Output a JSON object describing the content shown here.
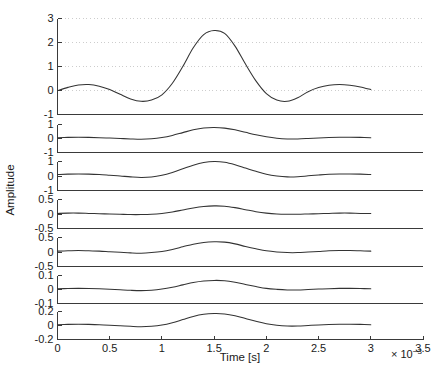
{
  "figure": {
    "xlabel": "Time [s]",
    "ylabel": "Amplitude",
    "x_exponent_base": "× 10",
    "x_exponent_power": "−3",
    "background_color": "#ffffff",
    "line_color": "#333333",
    "axis_color": "#3a3a3a",
    "grid_color": "#c8c8c8"
  },
  "chart_data": {
    "type": "line",
    "title": "",
    "subtitle": "",
    "xlabel": "Time [s]",
    "ylabel": "Amplitude",
    "x_scale_factor": "1e-3",
    "x_tick_labels": [
      "0",
      "0.5",
      "1",
      "1.5",
      "2",
      "2.5",
      "3",
      "3.5"
    ],
    "x_ticks": [
      0,
      0.5,
      1,
      1.5,
      2,
      2.5,
      3,
      3.5
    ],
    "xlim": [
      0,
      3.5
    ],
    "legend": "none",
    "grid": "horizontal dotted on panel 1 only",
    "layout": "7 stacked subplots sharing one x-axis",
    "panels": [
      {
        "index": 1,
        "ylim": [
          -1,
          3
        ],
        "y_ticks": [
          -1,
          0,
          1,
          2,
          3
        ],
        "y_tick_labels": [
          "-1",
          "0",
          "1",
          "2",
          "3"
        ],
        "grid": true,
        "peak_value": 2.5,
        "peak_time": 1.5,
        "x": [
          0,
          0.1,
          0.2,
          0.3,
          0.4,
          0.5,
          0.6,
          0.7,
          0.8,
          0.9,
          1.0,
          1.1,
          1.2,
          1.3,
          1.4,
          1.5,
          1.6,
          1.7,
          1.8,
          1.9,
          2.0,
          2.1,
          2.2,
          2.3,
          2.4,
          2.5,
          2.6,
          2.7,
          2.8,
          2.9,
          3.0
        ],
        "y": [
          0.0,
          0.13,
          0.23,
          0.25,
          0.18,
          0.04,
          -0.16,
          -0.35,
          -0.45,
          -0.4,
          -0.18,
          0.3,
          1.0,
          1.78,
          2.33,
          2.5,
          2.38,
          1.85,
          1.1,
          0.4,
          -0.13,
          -0.4,
          -0.45,
          -0.3,
          -0.05,
          0.12,
          0.22,
          0.25,
          0.22,
          0.15,
          0.04
        ]
      },
      {
        "index": 2,
        "ylim": [
          -1,
          1
        ],
        "y_ticks": [
          -1,
          0,
          1
        ],
        "y_tick_labels": [
          "-1",
          "0",
          "1"
        ],
        "grid": false,
        "peak_value": 0.78,
        "peak_time": 1.5,
        "x": [
          0,
          0.1,
          0.2,
          0.3,
          0.4,
          0.5,
          0.6,
          0.7,
          0.8,
          0.9,
          1.0,
          1.1,
          1.2,
          1.3,
          1.4,
          1.5,
          1.6,
          1.7,
          1.8,
          1.9,
          2.0,
          2.1,
          2.2,
          2.3,
          2.4,
          2.5,
          2.6,
          2.7,
          2.8,
          2.9,
          3.0
        ],
        "y": [
          0.06,
          0.08,
          0.09,
          0.08,
          0.06,
          0.03,
          0.0,
          -0.03,
          -0.05,
          -0.02,
          0.07,
          0.22,
          0.42,
          0.62,
          0.75,
          0.78,
          0.74,
          0.62,
          0.44,
          0.26,
          0.12,
          0.02,
          -0.03,
          -0.03,
          0.0,
          0.04,
          0.07,
          0.09,
          0.09,
          0.08,
          0.06
        ]
      },
      {
        "index": 3,
        "ylim": [
          -1,
          1
        ],
        "y_ticks": [
          -1,
          0,
          1
        ],
        "y_tick_labels": [
          "-1",
          "0",
          "1"
        ],
        "grid": false,
        "peak_value": 1.0,
        "peak_time": 1.5,
        "x": [
          0,
          0.1,
          0.2,
          0.3,
          0.4,
          0.5,
          0.6,
          0.7,
          0.8,
          0.9,
          1.0,
          1.1,
          1.2,
          1.3,
          1.4,
          1.5,
          1.6,
          1.7,
          1.8,
          1.9,
          2.0,
          2.1,
          2.2,
          2.3,
          2.4,
          2.5,
          2.6,
          2.7,
          2.8,
          2.9,
          3.0
        ],
        "y": [
          0.1,
          0.13,
          0.14,
          0.13,
          0.1,
          0.05,
          0.0,
          -0.06,
          -0.1,
          -0.07,
          0.05,
          0.25,
          0.5,
          0.75,
          0.93,
          1.0,
          0.95,
          0.78,
          0.55,
          0.32,
          0.12,
          0.0,
          -0.06,
          -0.05,
          0.01,
          0.07,
          0.12,
          0.14,
          0.14,
          0.13,
          0.1
        ]
      },
      {
        "index": 4,
        "ylim": [
          -0.5,
          0.5
        ],
        "y_ticks": [
          -0.5,
          0,
          0.5
        ],
        "y_tick_labels": [
          "-0.5",
          "0",
          "0.5"
        ],
        "grid": false,
        "peak_value": 0.28,
        "peak_time": 1.5,
        "x": [
          0,
          0.1,
          0.2,
          0.3,
          0.4,
          0.5,
          0.6,
          0.7,
          0.8,
          0.9,
          1.0,
          1.1,
          1.2,
          1.3,
          1.4,
          1.5,
          1.6,
          1.7,
          1.8,
          1.9,
          2.0,
          2.1,
          2.2,
          2.3,
          2.4,
          2.5,
          2.6,
          2.7,
          2.8,
          2.9,
          3.0
        ],
        "y": [
          0.02,
          0.03,
          0.03,
          0.02,
          0.01,
          0.0,
          -0.01,
          -0.02,
          -0.02,
          -0.01,
          0.02,
          0.07,
          0.14,
          0.21,
          0.26,
          0.28,
          0.27,
          0.22,
          0.15,
          0.08,
          0.03,
          0.0,
          -0.01,
          -0.01,
          0.0,
          0.01,
          0.02,
          0.03,
          0.03,
          0.02,
          0.02
        ]
      },
      {
        "index": 5,
        "ylim": [
          -0.5,
          0.5
        ],
        "y_ticks": [
          -0.5,
          0,
          0.5
        ],
        "y_tick_labels": [
          "-0.5",
          "0",
          "0.5"
        ],
        "grid": false,
        "peak_value": 0.35,
        "peak_time": 1.5,
        "x": [
          0,
          0.1,
          0.2,
          0.3,
          0.4,
          0.5,
          0.6,
          0.7,
          0.8,
          0.9,
          1.0,
          1.1,
          1.2,
          1.3,
          1.4,
          1.5,
          1.6,
          1.7,
          1.8,
          1.9,
          2.0,
          2.1,
          2.2,
          2.3,
          2.4,
          2.5,
          2.6,
          2.7,
          2.8,
          2.9,
          3.0
        ],
        "y": [
          0.03,
          0.04,
          0.05,
          0.04,
          0.03,
          0.01,
          -0.01,
          -0.03,
          -0.04,
          -0.02,
          0.02,
          0.09,
          0.18,
          0.27,
          0.33,
          0.35,
          0.34,
          0.28,
          0.19,
          0.11,
          0.04,
          0.0,
          -0.02,
          -0.02,
          0.0,
          0.02,
          0.04,
          0.05,
          0.05,
          0.04,
          0.03
        ]
      },
      {
        "index": 6,
        "ylim": [
          -0.1,
          0.1
        ],
        "y_ticks": [
          -0.1,
          0,
          0.1
        ],
        "y_tick_labels": [
          "-0.1",
          "0",
          "0.1"
        ],
        "grid": false,
        "peak_value": 0.065,
        "peak_time": 1.5,
        "x": [
          0,
          0.1,
          0.2,
          0.3,
          0.4,
          0.5,
          0.6,
          0.7,
          0.8,
          0.9,
          1.0,
          1.1,
          1.2,
          1.3,
          1.4,
          1.5,
          1.6,
          1.7,
          1.8,
          1.9,
          2.0,
          2.1,
          2.2,
          2.3,
          2.4,
          2.5,
          2.6,
          2.7,
          2.8,
          2.9,
          3.0
        ],
        "y": [
          0.005,
          0.007,
          0.008,
          0.007,
          0.005,
          0.002,
          -0.002,
          -0.006,
          -0.008,
          -0.005,
          0.003,
          0.016,
          0.033,
          0.05,
          0.061,
          0.065,
          0.063,
          0.052,
          0.036,
          0.021,
          0.008,
          0.001,
          -0.003,
          -0.003,
          0.0,
          0.003,
          0.006,
          0.008,
          0.008,
          0.007,
          0.005
        ]
      },
      {
        "index": 7,
        "ylim": [
          -0.2,
          0.2
        ],
        "y_ticks": [
          -0.2,
          0,
          0.2
        ],
        "y_tick_labels": [
          "-0.2",
          "0",
          "0.2"
        ],
        "grid": false,
        "peak_value": 0.17,
        "peak_time": 1.5,
        "x": [
          0,
          0.1,
          0.2,
          0.3,
          0.4,
          0.5,
          0.6,
          0.7,
          0.8,
          0.9,
          1.0,
          1.1,
          1.2,
          1.3,
          1.4,
          1.5,
          1.6,
          1.7,
          1.8,
          1.9,
          2.0,
          2.1,
          2.2,
          2.3,
          2.4,
          2.5,
          2.6,
          2.7,
          2.8,
          2.9,
          3.0
        ],
        "y": [
          0.012,
          0.016,
          0.018,
          0.016,
          0.012,
          0.005,
          -0.003,
          -0.012,
          -0.018,
          -0.012,
          0.006,
          0.04,
          0.085,
          0.13,
          0.16,
          0.17,
          0.165,
          0.14,
          0.1,
          0.06,
          0.025,
          0.003,
          -0.008,
          -0.008,
          0.0,
          0.008,
          0.014,
          0.018,
          0.018,
          0.016,
          0.012
        ]
      }
    ]
  }
}
